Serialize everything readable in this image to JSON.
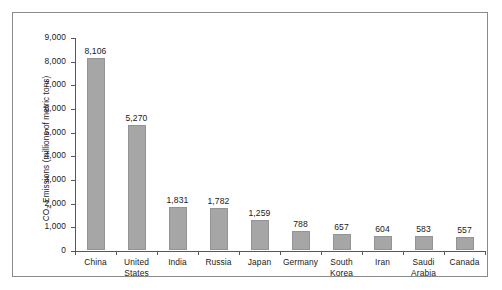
{
  "chart_data": {
    "type": "bar",
    "title": "",
    "subtitle": "",
    "xlabel": "",
    "ylabel": "CO2 Emissions (millions of metric tons)",
    "ylabel_prefix": "CO",
    "ylabel_sub": "2",
    "ylabel_suffix": " Emissions (millions of metric tons)",
    "categories": [
      "China",
      "United States",
      "India",
      "Russia",
      "Japan",
      "Germany",
      "South Korea",
      "Iran",
      "Saudi Arabia",
      "Canada"
    ],
    "category_lines": [
      [
        "China"
      ],
      [
        "United",
        "States"
      ],
      [
        "India"
      ],
      [
        "Russia"
      ],
      [
        "Japan"
      ],
      [
        "Germany"
      ],
      [
        "South",
        "Korea"
      ],
      [
        "Iran"
      ],
      [
        "Saudi",
        "Arabia"
      ],
      [
        "Canada"
      ]
    ],
    "values": [
      8106,
      5270,
      1831,
      1782,
      1259,
      788,
      657,
      604,
      583,
      557
    ],
    "value_labels": [
      "8,106",
      "5,270",
      "1,831",
      "1,782",
      "1,259",
      "788",
      "657",
      "604",
      "583",
      "557"
    ],
    "ylim": [
      0,
      9000
    ],
    "ytick_values": [
      0,
      1000,
      2000,
      3000,
      4000,
      5000,
      6000,
      7000,
      8000,
      9000
    ],
    "ytick_labels": [
      "0",
      "1,000",
      "2,000",
      "3,000",
      "4,000",
      "5,000",
      "6,000",
      "7,000",
      "8,000",
      "9,000"
    ],
    "grid": false,
    "legend": null,
    "legend_position": "none",
    "bar_color": "#a6a6a6",
    "bar_border_color": "#949494",
    "axis_color": "#58585a",
    "text_color": "#1a1a1a",
    "frame_color": "#8a8a8a",
    "background_color": "#ffffff"
  }
}
